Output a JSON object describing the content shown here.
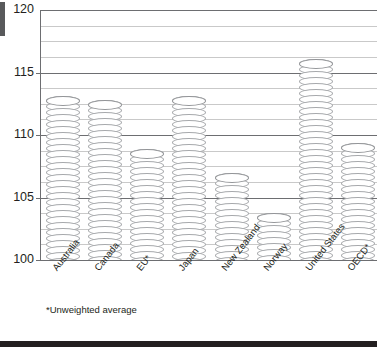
{
  "chart_data": {
    "type": "bar",
    "title": "",
    "xlabel": "",
    "ylabel": "",
    "ylim": [
      100,
      120
    ],
    "yticks": [
      100,
      105,
      110,
      115,
      120
    ],
    "minor_gridlines": true,
    "grid": true,
    "legend": null,
    "categories": [
      "Australia",
      "Canada",
      "EU*",
      "Japan",
      "New Zealand",
      "Norway",
      "United States",
      "OECD*"
    ],
    "values": [
      113.1,
      112.8,
      108.9,
      113.1,
      107.0,
      103.8,
      116.1,
      109.4
    ],
    "annotations": [
      "*Unweighted average"
    ]
  },
  "axis": {
    "ticks": [
      {
        "label": "120",
        "value": 120
      },
      {
        "label": "115",
        "value": 115
      },
      {
        "label": "110",
        "value": 110
      },
      {
        "label": "105",
        "value": 105
      },
      {
        "label": "100",
        "value": 100
      }
    ]
  },
  "footnote": "*Unweighted average",
  "colors": {
    "bar_outline": "#a7a9ac",
    "bar_fill": "#ffffff",
    "major_grid": "#6d6e71",
    "minor_grid": "#c9c9c9",
    "text": "#231f20",
    "rule": "#231f20"
  }
}
